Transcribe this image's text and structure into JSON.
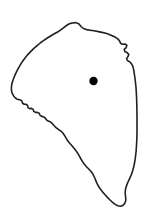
{
  "figure": {
    "type": "outline-map",
    "canvas": {
      "width": 161,
      "height": 220
    },
    "background_color": "#ffffff"
  },
  "boundary": {
    "name": "region-outline",
    "stroke_color": "#231f20",
    "fill_color": "#ffffff",
    "stroke_width": 1.6,
    "closed": true,
    "description": "Irregular closed polygon, broad and rounded across the top, bulging left at mid-height, with a jagged stepped edge running down-right from the left bulge, a stepped vertical right edge, tapering to a rounded point near the bottom",
    "points": [
      [
        72.5,
        23.0
      ],
      [
        76.0,
        22.6
      ],
      [
        79.0,
        24.0
      ],
      [
        81.0,
        26.5
      ],
      [
        83.5,
        28.5
      ],
      [
        86.5,
        29.6
      ],
      [
        90.0,
        30.2
      ],
      [
        94.0,
        30.8
      ],
      [
        98.5,
        31.6
      ],
      [
        103.0,
        32.6
      ],
      [
        107.5,
        33.8
      ],
      [
        111.0,
        35.2
      ],
      [
        114.5,
        36.8
      ],
      [
        117.5,
        38.6
      ],
      [
        119.5,
        40.8
      ],
      [
        120.5,
        43.2
      ],
      [
        122.5,
        44.2
      ],
      [
        125.0,
        44.0
      ],
      [
        126.8,
        45.2
      ],
      [
        126.2,
        47.6
      ],
      [
        124.2,
        49.4
      ],
      [
        124.8,
        51.6
      ],
      [
        127.0,
        52.6
      ],
      [
        128.8,
        54.4
      ],
      [
        128.0,
        56.6
      ],
      [
        126.6,
        58.4
      ],
      [
        127.4,
        60.6
      ],
      [
        129.6,
        61.8
      ],
      [
        131.4,
        63.6
      ],
      [
        132.8,
        66.2
      ],
      [
        133.6,
        69.4
      ],
      [
        134.2,
        73.0
      ],
      [
        134.8,
        77.0
      ],
      [
        135.4,
        81.5
      ],
      [
        135.9,
        86.5
      ],
      [
        136.3,
        92.0
      ],
      [
        136.6,
        98.0
      ],
      [
        136.8,
        104.5
      ],
      [
        136.9,
        111.0
      ],
      [
        137.0,
        117.5
      ],
      [
        137.0,
        124.0
      ],
      [
        137.0,
        130.5
      ],
      [
        136.9,
        137.0
      ],
      [
        136.6,
        143.5
      ],
      [
        136.2,
        150.0
      ],
      [
        135.6,
        156.0
      ],
      [
        134.8,
        161.5
      ],
      [
        133.8,
        166.5
      ],
      [
        132.6,
        171.0
      ],
      [
        131.2,
        175.0
      ],
      [
        129.6,
        178.6
      ],
      [
        128.0,
        182.0
      ],
      [
        126.6,
        185.4
      ],
      [
        125.6,
        188.8
      ],
      [
        125.2,
        192.2
      ],
      [
        125.4,
        195.4
      ],
      [
        125.8,
        198.4
      ],
      [
        125.6,
        201.2
      ],
      [
        124.6,
        203.6
      ],
      [
        122.8,
        205.4
      ],
      [
        120.4,
        206.2
      ],
      [
        117.8,
        205.8
      ],
      [
        115.2,
        204.4
      ],
      [
        112.6,
        202.4
      ],
      [
        110.0,
        200.0
      ],
      [
        107.4,
        197.4
      ],
      [
        105.0,
        194.8
      ],
      [
        102.8,
        192.2
      ],
      [
        100.8,
        189.6
      ],
      [
        99.0,
        187.0
      ],
      [
        97.4,
        184.2
      ],
      [
        96.0,
        181.2
      ],
      [
        94.8,
        178.0
      ],
      [
        93.4,
        175.0
      ],
      [
        91.8,
        172.4
      ],
      [
        90.0,
        170.2
      ],
      [
        88.0,
        168.2
      ],
      [
        86.0,
        166.2
      ],
      [
        84.2,
        164.0
      ],
      [
        82.6,
        161.6
      ],
      [
        81.0,
        159.0
      ],
      [
        79.4,
        156.2
      ],
      [
        77.8,
        153.4
      ],
      [
        76.0,
        150.8
      ],
      [
        74.2,
        148.4
      ],
      [
        72.4,
        146.2
      ],
      [
        70.6,
        144.2
      ],
      [
        68.8,
        142.2
      ],
      [
        67.2,
        140.0
      ],
      [
        65.8,
        137.6
      ],
      [
        64.4,
        135.2
      ],
      [
        62.8,
        133.0
      ],
      [
        61.0,
        131.2
      ],
      [
        59.0,
        129.8
      ],
      [
        57.0,
        128.4
      ],
      [
        55.2,
        126.8
      ],
      [
        53.6,
        125.0
      ],
      [
        52.0,
        123.2
      ],
      [
        50.2,
        121.8
      ],
      [
        48.2,
        121.0
      ],
      [
        46.4,
        119.8
      ],
      [
        45.2,
        118.0
      ],
      [
        43.6,
        116.8
      ],
      [
        41.6,
        116.4
      ],
      [
        40.0,
        115.2
      ],
      [
        39.2,
        113.2
      ],
      [
        37.4,
        112.4
      ],
      [
        35.4,
        112.4
      ],
      [
        33.8,
        111.4
      ],
      [
        33.2,
        109.4
      ],
      [
        31.6,
        108.4
      ],
      [
        29.6,
        108.6
      ],
      [
        28.0,
        107.6
      ],
      [
        27.6,
        105.6
      ],
      [
        26.2,
        104.4
      ],
      [
        24.2,
        104.2
      ],
      [
        22.6,
        103.2
      ],
      [
        22.0,
        101.2
      ],
      [
        20.6,
        100.0
      ],
      [
        18.6,
        99.6
      ],
      [
        16.8,
        99.0
      ],
      [
        15.2,
        97.8
      ],
      [
        13.8,
        96.2
      ],
      [
        12.6,
        94.2
      ],
      [
        11.8,
        92.0
      ],
      [
        11.4,
        89.6
      ],
      [
        11.4,
        87.0
      ],
      [
        11.8,
        84.2
      ],
      [
        12.6,
        81.2
      ],
      [
        13.8,
        78.0
      ],
      [
        15.2,
        74.6
      ],
      [
        16.8,
        71.2
      ],
      [
        18.6,
        67.8
      ],
      [
        20.6,
        64.4
      ],
      [
        22.8,
        61.0
      ],
      [
        25.2,
        57.8
      ],
      [
        27.8,
        54.6
      ],
      [
        30.6,
        51.6
      ],
      [
        33.6,
        48.6
      ],
      [
        36.8,
        45.8
      ],
      [
        40.2,
        43.0
      ],
      [
        43.8,
        40.4
      ],
      [
        47.4,
        38.0
      ],
      [
        51.0,
        35.8
      ],
      [
        54.4,
        33.8
      ],
      [
        57.6,
        32.0
      ],
      [
        60.4,
        30.2
      ],
      [
        62.8,
        28.4
      ],
      [
        65.0,
        26.6
      ],
      [
        67.2,
        25.0
      ],
      [
        69.6,
        23.6
      ]
    ]
  },
  "marker": {
    "name": "location-dot",
    "shape": "filled-circle",
    "color": "#000000",
    "cx": 93.5,
    "cy": 81.0,
    "r": 4.2,
    "label": ""
  }
}
